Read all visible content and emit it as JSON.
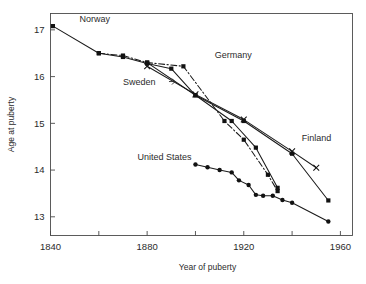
{
  "chart_data": {
    "type": "line",
    "title": "",
    "xlabel": "Year of puberty",
    "ylabel": "Age at puberty",
    "xlim": [
      1840,
      1965
    ],
    "ylim": [
      12.6,
      17.35
    ],
    "grid": false,
    "legend_position": "inline-annotations",
    "xticks": [
      1840,
      1860,
      1880,
      1900,
      1920,
      1940,
      1960
    ],
    "xtick_labels": [
      "1840",
      "",
      "1880",
      "",
      "1920",
      "",
      "1960"
    ],
    "yticks": [
      13,
      14,
      15,
      16,
      17
    ],
    "ytick_labels": [
      "13",
      "14",
      "15",
      "16",
      "17"
    ],
    "series": [
      {
        "name": "Norway",
        "marker": "filled-square",
        "line_style": "solid",
        "color": "#1a1a1a",
        "points": [
          [
            1841,
            17.08
          ],
          [
            1860,
            16.5
          ],
          [
            1870,
            16.42
          ],
          [
            1880,
            16.28
          ],
          [
            1890,
            16.17
          ],
          [
            1900,
            15.6
          ],
          [
            1920,
            15.05
          ],
          [
            1940,
            14.35
          ],
          [
            1955,
            13.35
          ]
        ]
      },
      {
        "name": "Germany",
        "marker": "filled-square",
        "line_style": "dash-dot",
        "color": "#1a1a1a",
        "points": [
          [
            1860,
            16.5
          ],
          [
            1870,
            16.45
          ],
          [
            1880,
            16.3
          ],
          [
            1895,
            16.22
          ],
          [
            1912,
            15.05
          ],
          [
            1920,
            14.65
          ],
          [
            1930,
            13.9
          ],
          [
            1934,
            13.55
          ]
        ]
      },
      {
        "name": "Sweden",
        "marker": "filled-square",
        "line_style": "solid",
        "color": "#1a1a1a",
        "points": [
          [
            1880,
            16.3
          ],
          [
            1900,
            15.6
          ],
          [
            1915,
            15.05
          ],
          [
            1925,
            14.48
          ],
          [
            1934,
            13.62
          ]
        ]
      },
      {
        "name": "Finland",
        "marker": "cross",
        "line_style": "solid",
        "color": "#1a1a1a",
        "points": [
          [
            1880,
            16.22
          ],
          [
            1900,
            15.62
          ],
          [
            1920,
            15.08
          ],
          [
            1940,
            14.4
          ],
          [
            1950,
            14.05
          ]
        ]
      },
      {
        "name": "United States",
        "marker": "filled-circle",
        "line_style": "solid",
        "color": "#1a1a1a",
        "points": [
          [
            1900,
            14.12
          ],
          [
            1905,
            14.06
          ],
          [
            1910,
            14.0
          ],
          [
            1915,
            13.95
          ],
          [
            1918,
            13.78
          ],
          [
            1922,
            13.68
          ],
          [
            1925,
            13.47
          ],
          [
            1928,
            13.45
          ],
          [
            1932,
            13.45
          ],
          [
            1936,
            13.36
          ],
          [
            1940,
            13.3
          ],
          [
            1955,
            12.9
          ]
        ]
      }
    ],
    "annotations": [
      {
        "text": "Norway",
        "x": 1852,
        "y": 17.17,
        "pointer": false
      },
      {
        "text": "Germany",
        "x": 1908,
        "y": 16.4,
        "pointer": false
      },
      {
        "text": "Sweden",
        "x": 1870,
        "y": 15.83,
        "pointer": true
      },
      {
        "text": "Finland",
        "x": 1944,
        "y": 14.62,
        "pointer": false
      },
      {
        "text": "United States",
        "x": 1876,
        "y": 14.22,
        "pointer": false
      }
    ]
  }
}
